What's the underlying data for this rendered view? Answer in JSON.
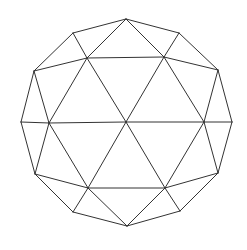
{
  "diagram": {
    "type": "geodesic-polyhedron-wireframe",
    "stroke": "#333333",
    "background": "#ffffff",
    "vertices": {
      "o0": [
        126,
        19
      ],
      "o1": [
        179,
        33
      ],
      "o2": [
        218,
        70
      ],
      "o3": [
        232,
        122
      ],
      "o4": [
        218,
        173
      ],
      "o5": [
        180,
        211
      ],
      "o6": [
        127,
        226
      ],
      "o7": [
        73,
        212
      ],
      "o8": [
        35,
        174
      ],
      "o9": [
        21,
        122
      ],
      "o10": [
        34,
        71
      ],
      "o11": [
        73,
        33
      ],
      "i0": [
        87,
        58
      ],
      "i1": [
        164,
        57
      ],
      "i2": [
        204,
        122
      ],
      "i3": [
        165,
        188
      ],
      "i4": [
        88,
        188
      ],
      "i5": [
        49,
        123
      ],
      "c": [
        126,
        122
      ]
    },
    "edges": [
      [
        "o0",
        "o1"
      ],
      [
        "o1",
        "o2"
      ],
      [
        "o2",
        "o3"
      ],
      [
        "o3",
        "o4"
      ],
      [
        "o4",
        "o5"
      ],
      [
        "o5",
        "o6"
      ],
      [
        "o6",
        "o7"
      ],
      [
        "o7",
        "o8"
      ],
      [
        "o8",
        "o9"
      ],
      [
        "o9",
        "o10"
      ],
      [
        "o10",
        "o11"
      ],
      [
        "o11",
        "o0"
      ],
      [
        "i0",
        "i1"
      ],
      [
        "i1",
        "i2"
      ],
      [
        "i2",
        "i3"
      ],
      [
        "i3",
        "i4"
      ],
      [
        "i4",
        "i5"
      ],
      [
        "i5",
        "i0"
      ],
      [
        "c",
        "i0"
      ],
      [
        "c",
        "i1"
      ],
      [
        "c",
        "i2"
      ],
      [
        "c",
        "i3"
      ],
      [
        "c",
        "i4"
      ],
      [
        "c",
        "i5"
      ],
      [
        "o0",
        "i0"
      ],
      [
        "o0",
        "i1"
      ],
      [
        "o11",
        "i0"
      ],
      [
        "o10",
        "i0"
      ],
      [
        "o1",
        "i1"
      ],
      [
        "o2",
        "i1"
      ],
      [
        "o2",
        "i2"
      ],
      [
        "o3",
        "i2"
      ],
      [
        "o4",
        "i2"
      ],
      [
        "o4",
        "i3"
      ],
      [
        "o5",
        "i3"
      ],
      [
        "o6",
        "i3"
      ],
      [
        "o6",
        "i4"
      ],
      [
        "o7",
        "i4"
      ],
      [
        "o8",
        "i4"
      ],
      [
        "o8",
        "i5"
      ],
      [
        "o9",
        "i5"
      ],
      [
        "o10",
        "i5"
      ]
    ]
  }
}
